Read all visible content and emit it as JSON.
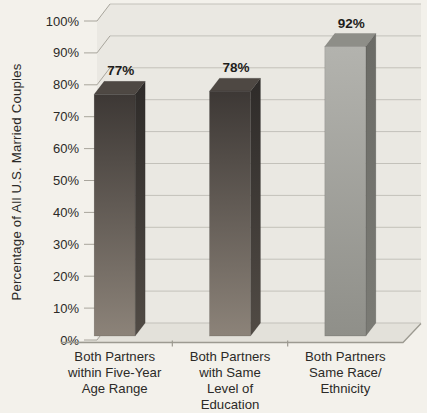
{
  "chart_data": {
    "type": "bar",
    "style": "3d-column",
    "title": "",
    "xlabel": "",
    "ylabel": "Percentage of All U.S. Married Couples",
    "ylim": [
      0,
      100
    ],
    "ytick_step": 10,
    "yticks": [
      "0%",
      "10%",
      "20%",
      "30%",
      "40%",
      "50%",
      "60%",
      "70%",
      "80%",
      "90%",
      "100%"
    ],
    "grid": true,
    "legend": "none",
    "categories": [
      "Both Partners within Five-Year Age Range",
      "Both Partners with Same Level of Education",
      "Both Partners Same Race/Ethnicity"
    ],
    "categories_lines": [
      [
        "Both Partners",
        "within Five-Year",
        "Age Range"
      ],
      [
        "Both Partners",
        "with Same",
        "Level of",
        "Education"
      ],
      [
        "Both Partners",
        "Same Race/",
        "Ethnicity"
      ]
    ],
    "values": [
      77,
      78,
      92
    ],
    "value_labels": [
      "77%",
      "78%",
      "92%"
    ],
    "bar_palette": [
      "dark",
      "dark",
      "silver"
    ],
    "colors": {
      "background": "#f3f1eb",
      "wall": "#eae8e2",
      "floor": "#e3e1da",
      "gridline": "#c3c1ba",
      "axis_line": "#9c9a91",
      "tick_line": "#a8a59c",
      "text": "#2b2a27",
      "value_label_text": "#1e1d1b",
      "bar_dark_front_top": "#3d3835",
      "bar_dark_front_bottom": "#8c8379",
      "bar_dark_side_top": "#2e2b29",
      "bar_dark_side_bottom": "#514b45",
      "bar_dark_top_face": "#4e4843",
      "bar_light_front_top": "#b3b3ae",
      "bar_light_front_bottom": "#8f8f89",
      "bar_light_side_top": "#6b6b66",
      "bar_light_side_bottom": "#7b7b75",
      "bar_light_top_face": "#8e8e88"
    }
  }
}
